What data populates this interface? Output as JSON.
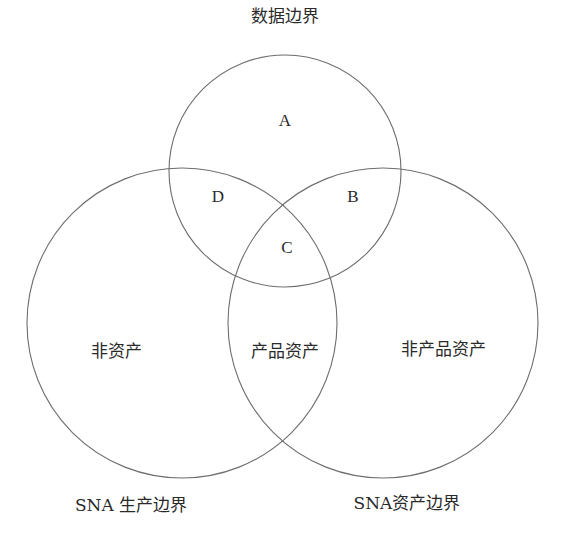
{
  "diagram": {
    "type": "venn",
    "sets": [
      {
        "id": "data",
        "label": "数据边界",
        "cx": 285,
        "cy": 171,
        "r": 116
      },
      {
        "id": "production",
        "label": "SNA 生产边界",
        "cx": 182,
        "cy": 323,
        "r": 155
      },
      {
        "id": "asset",
        "label": "SNA资产边界",
        "cx": 383,
        "cy": 323,
        "r": 155
      }
    ],
    "regions": {
      "A": "A",
      "B": "B",
      "C": "C",
      "D": "D",
      "non_asset": "非资产",
      "product_asset": "产品资产",
      "non_product_asset": "非产品资产"
    },
    "colors": {
      "stroke": "#6e6e6e",
      "text": "#2a2a2a",
      "background": "#ffffff"
    }
  }
}
